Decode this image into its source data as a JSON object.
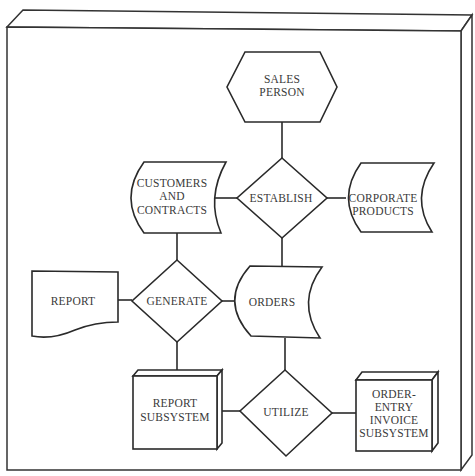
{
  "diagram": {
    "nodes": {
      "sales_person": {
        "shape": "hexagon",
        "lines": [
          "SALES",
          "PERSON"
        ]
      },
      "establish": {
        "shape": "diamond",
        "lines": [
          "ESTABLISH"
        ]
      },
      "customers_and_contracts": {
        "shape": "stored-data",
        "lines": [
          "CUSTOMERS",
          "AND",
          "CONTRACTS"
        ]
      },
      "corporate_products": {
        "shape": "stored-data",
        "lines": [
          "CORPORATE",
          "PRODUCTS"
        ]
      },
      "report": {
        "shape": "document",
        "lines": [
          "REPORT"
        ]
      },
      "generate": {
        "shape": "diamond",
        "lines": [
          "GENERATE"
        ]
      },
      "orders": {
        "shape": "stored-data",
        "lines": [
          "ORDERS"
        ]
      },
      "report_subsystem": {
        "shape": "3d-box",
        "lines": [
          "REPORT",
          "SUBSYSTEM"
        ]
      },
      "utilize": {
        "shape": "diamond",
        "lines": [
          "UTILIZE"
        ]
      },
      "order_entry_invoice_subsystem": {
        "shape": "3d-box",
        "lines": [
          "ORDER-",
          "ENTRY",
          "INVOICE",
          "SUBSYSTEM"
        ]
      }
    },
    "edges": [
      [
        "sales_person",
        "establish"
      ],
      [
        "establish",
        "customers_and_contracts"
      ],
      [
        "establish",
        "corporate_products"
      ],
      [
        "establish",
        "orders"
      ],
      [
        "customers_and_contracts",
        "generate"
      ],
      [
        "generate",
        "report"
      ],
      [
        "generate",
        "orders"
      ],
      [
        "generate",
        "report_subsystem"
      ],
      [
        "orders",
        "utilize"
      ],
      [
        "utilize",
        "report_subsystem"
      ],
      [
        "utilize",
        "order_entry_invoice_subsystem"
      ]
    ]
  }
}
